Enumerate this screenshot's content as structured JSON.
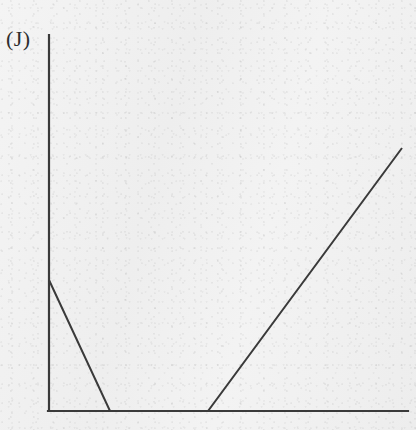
{
  "figure": {
    "panel_label": "(J)",
    "width": 416,
    "height": 430,
    "background_color": "#f2f2f2",
    "ink_color": "#3a3a3a"
  },
  "chart_data": {
    "type": "line",
    "title": "(J)",
    "xlabel": "",
    "ylabel": "",
    "grid": false,
    "legend": null,
    "axes": {
      "origin_px": [
        49,
        411
      ],
      "y_axis_top_px": [
        49,
        35
      ],
      "x_axis_right_px": [
        408,
        411
      ],
      "x_axis_visible": true,
      "y_axis_visible": true,
      "ticks": [],
      "tick_labels": [],
      "xlim": [
        0,
        1
      ],
      "ylim": [
        0,
        1
      ]
    },
    "series": [
      {
        "name": "piecewise-curve",
        "color": "#3a3a3a",
        "stroke_width": 2,
        "points_px": [
          [
            49,
            280
          ],
          [
            110,
            411
          ],
          [
            208,
            411
          ],
          [
            402,
            148
          ]
        ],
        "x": [
          0.0,
          0.17,
          0.44,
          0.98
        ],
        "y": [
          0.35,
          0.0,
          0.0,
          0.7
        ],
        "segments": [
          {
            "name": "descending",
            "from_px": [
              49,
              280
            ],
            "to_px": [
              110,
              411
            ],
            "slope": "negative"
          },
          {
            "name": "flat-zero",
            "from_px": [
              110,
              411
            ],
            "to_px": [
              208,
              411
            ],
            "slope": "zero"
          },
          {
            "name": "ascending",
            "from_px": [
              208,
              411
            ],
            "to_px": [
              402,
              148
            ],
            "slope": "positive"
          }
        ]
      }
    ]
  }
}
